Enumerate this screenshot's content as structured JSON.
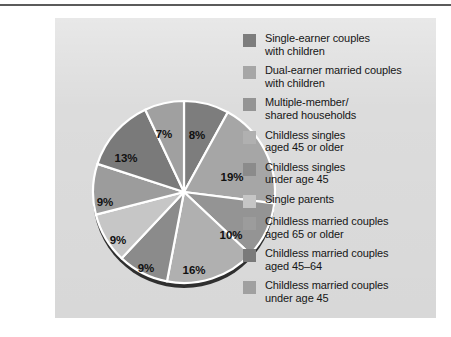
{
  "figure": {
    "background_color": "#dcdcdc",
    "page_background": "#ffffff",
    "rule_color": "#5b5b5b"
  },
  "chart_data": {
    "type": "pie",
    "title": "",
    "subtitle": "",
    "xlabel": "",
    "ylabel": "",
    "legend_position": "right",
    "grid": false,
    "units": "percent",
    "start_angle_deg": 0,
    "direction": "clockwise",
    "categories": [
      "Single-earner couples with children",
      "Dual-earner married couples with children",
      "Multiple-member/ shared households",
      "Childless singles aged 45 or older",
      "Childless singles under age 45",
      "Single parents",
      "Childless married couples aged 65 or older",
      "Childless married couples aged 45–64",
      "Childless married couples under age 45"
    ],
    "values": [
      8,
      19,
      10,
      16,
      9,
      9,
      9,
      13,
      7
    ],
    "data_labels": [
      "8%",
      "19%",
      "10%",
      "16%",
      "9%",
      "9%",
      "9%",
      "13%",
      "7%"
    ],
    "colors": [
      "#7d7d7d",
      "#a6a6a6",
      "#949494",
      "#b0b0b0",
      "#8b8b8b",
      "#c6c6c6",
      "#9c9c9c",
      "#7a7a7a",
      "#a0a0a0"
    ],
    "slice_separator_color": "#ffffff",
    "shadow_color": "#2a2a2a"
  },
  "legend": {
    "items": [
      {
        "label": "Single-earner couples\nwith children",
        "color": "#7d7d7d",
        "value": "8%"
      },
      {
        "label": "Dual-earner married couples\nwith children",
        "color": "#a6a6a6",
        "value": "19%"
      },
      {
        "label": "Multiple-member/\nshared households",
        "color": "#949494",
        "value": "10%"
      },
      {
        "label": "Childless singles\naged 45 or older",
        "color": "#b0b0b0",
        "value": "16%"
      },
      {
        "label": "Childless singles\nunder age 45",
        "color": "#8b8b8b",
        "value": "9%"
      },
      {
        "label": "Single parents",
        "color": "#c6c6c6",
        "value": "9%"
      },
      {
        "label": "Childless married couples\naged 65 or older",
        "color": "#9c9c9c",
        "value": "9%"
      },
      {
        "label": "Childless married couples\naged 45–64",
        "color": "#7a7a7a",
        "value": "13%"
      },
      {
        "label": "Childless married couples\nunder age 45",
        "color": "#a0a0a0",
        "value": "7%"
      }
    ]
  },
  "pie_labels": [
    {
      "text": "8%",
      "x": 107,
      "y": 45
    },
    {
      "text": "19%",
      "x": 142,
      "y": 87
    },
    {
      "text": "10%",
      "x": 141,
      "y": 145
    },
    {
      "text": "16%",
      "x": 104,
      "y": 180
    },
    {
      "text": "9%",
      "x": 56,
      "y": 178
    },
    {
      "text": "9%",
      "x": 28,
      "y": 150
    },
    {
      "text": "9%",
      "x": 15,
      "y": 112
    },
    {
      "text": "13%",
      "x": 36,
      "y": 68
    },
    {
      "text": "7%",
      "x": 74,
      "y": 44
    }
  ]
}
